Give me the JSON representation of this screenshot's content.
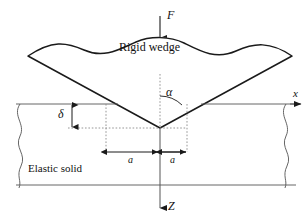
{
  "figure": {
    "type": "mechanics-schematic",
    "background_color": "#ffffff",
    "line_color": "#1a1a1a",
    "guide_color": "#808080",
    "text_color": "#111111"
  },
  "labels": {
    "force": "F",
    "wedge": "Rigid wedge",
    "alpha": "α",
    "delta": "δ",
    "contact_half_width_left": "a",
    "contact_half_width_right": "a",
    "solid": "Elastic solid",
    "axis_x": "x",
    "axis_z": "Z"
  },
  "geometry": {
    "surface_line_y": 104,
    "bottom_line_y": 185,
    "apex_x": 160,
    "apex_y": 128,
    "left_guide_x": 106,
    "right_guide_x": 187,
    "wedge_left_tip_x": 28,
    "wedge_right_tip_x": 292,
    "wedge_tip_y": 56,
    "x_axis_arrow_x": 300,
    "z_axis_arrow_y": 210,
    "force_arrow_top_y": 16,
    "force_arrow_bottom_y": 38
  },
  "annotations": {
    "angle_description": "half-wedge angle measured from the vertical centerline to the right flank",
    "delta_description": "indentation depth below the undeformed surface",
    "a_description": "contact half-width on each side of the apex"
  }
}
